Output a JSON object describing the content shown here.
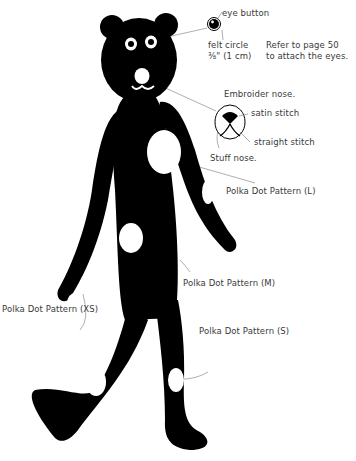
{
  "diagram": {
    "colors": {
      "body": "#000000",
      "dots": "#ffffff",
      "leader_line": "#9a9a9a",
      "text": "#3a3a3a"
    },
    "labels": {
      "eye_button": "eye button",
      "felt_circle_line1": "felt circle",
      "felt_circle_line2": "⅜\" (1 cm)",
      "eyes_ref_line1": "Refer to page 50",
      "eyes_ref_line2": "to attach the eyes.",
      "embroider_nose": "Embroider nose.",
      "satin_stitch": "satin stitch",
      "straight_stitch": "straight stitch",
      "stuff_nose": "Stuff nose.",
      "polka_l": "Polka Dot Pattern (L)",
      "polka_m": "Polka Dot Pattern (M)",
      "polka_xs": "Polka Dot Pattern (XS)",
      "polka_s": "Polka Dot Pattern (S)"
    }
  }
}
